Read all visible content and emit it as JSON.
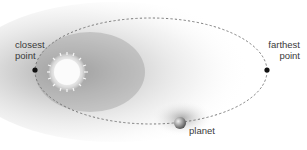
{
  "diagram": {
    "type": "orbit-ellipse",
    "labels": {
      "closest_line1": "closest",
      "closest_line2": "point",
      "farthest_line1": "farthest",
      "farthest_line2": "point",
      "planet": "planet"
    },
    "elements": {
      "star": {
        "name": "sun",
        "cx": 67,
        "cy": 72,
        "r": 13
      },
      "planet": {
        "cx": 180,
        "cy": 123,
        "r": 6
      },
      "orbit": {
        "cx": 151,
        "cy": 71,
        "rx": 116,
        "ry": 53,
        "style": "dashed"
      },
      "closest_point": {
        "x": 35,
        "y": 70
      },
      "farthest_point": {
        "x": 267,
        "y": 70
      }
    },
    "colors": {
      "orbit": "#7a7a7a",
      "point": "#111111",
      "label": "#3a3a3a",
      "shadow": "#8a8a8a"
    }
  }
}
